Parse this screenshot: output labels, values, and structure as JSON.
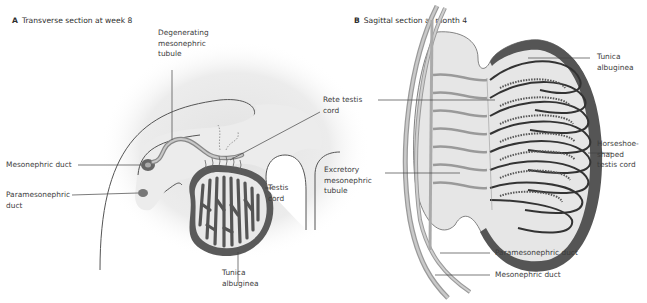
{
  "panels": [
    {
      "letter": "A",
      "title": "Transverse section at week 8",
      "labels": {
        "degenerating_tubule": "Degenerating\nmesonephric\ntubule",
        "mesonephric_duct": "Mesonephric duct",
        "paramesonephric_duct": "Paramesonephric\nduct",
        "rete_testis": "Rete testis\ncord",
        "testis_cord": "Testis\ncord",
        "tunica": "Tunica\nalbuginea"
      }
    },
    {
      "letter": "B",
      "title": "Sagittal section at month 4",
      "labels": {
        "tunica": "Tunica\nalbuginea",
        "horseshoe": "Horseshoe-\nshaped\ntestis cord",
        "excretory_tubule": "Excretory\nmesonephric\ntubule",
        "paramesonephric_duct": "Paramesonephric duct",
        "mesonephric_duct": "Mesonephric duct"
      }
    }
  ],
  "colors": {
    "tissue_fill": "#e6e6e6",
    "dark_tissue": "#5a5a5a",
    "duct": "#a8a8a8",
    "line": "#555555"
  }
}
